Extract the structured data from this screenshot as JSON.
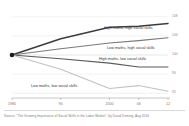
{
  "figure": {
    "background": "#ffffff",
    "source_note": "Source: \"The Growing Importance of Social Skills in the Labor Market\", by David Deming, Aug 2016"
  },
  "chart_data": {
    "type": "line",
    "title": "",
    "subtitle": "",
    "xlabel": "",
    "ylabel": "",
    "x": [
      1980,
      1990,
      2000,
      2006,
      2012
    ],
    "xtick_labels": [
      "1980",
      "90",
      "2000",
      "06",
      "12"
    ],
    "ytick_labels": [
      "108",
      "104",
      "100",
      "96",
      "92"
    ],
    "ytick_values": [
      108,
      104,
      100,
      96,
      92
    ],
    "ylim": [
      91,
      109
    ],
    "xlim": [
      1980,
      2012
    ],
    "grid": true,
    "grid_axis": "y",
    "legend": "inline-labels",
    "origin_marker": {
      "x": 1980,
      "y": 100,
      "color": "#1a1a1a"
    },
    "series": [
      {
        "name": "High maths, high social skills",
        "label": "High maths, high social skills",
        "color": "#3c3c3c",
        "width": 1.5,
        "x": [
          1980,
          1990,
          2000,
          2006,
          2012
        ],
        "values": [
          100,
          103.4,
          105.8,
          106.0,
          106.6
        ]
      },
      {
        "name": "Low maths, high social skills",
        "label": "Low maths, high social skills",
        "color": "#7a7a7a",
        "width": 1.1,
        "x": [
          1980,
          1990,
          2000,
          2006,
          2012
        ],
        "values": [
          100,
          101.3,
          102.5,
          103.0,
          103.6
        ]
      },
      {
        "name": "High maths, low social skills",
        "label": "High maths, low social skills",
        "color": "#5a5a5a",
        "width": 1.1,
        "x": [
          1980,
          1990,
          2000,
          2006,
          2012
        ],
        "values": [
          100,
          99.2,
          98.3,
          97.5,
          97.5
        ]
      },
      {
        "name": "Low maths, low social skills",
        "label": "Low maths, low social skills",
        "color": "#c2c2c2",
        "width": 1.1,
        "x": [
          1980,
          1990,
          2000,
          2006,
          2012
        ],
        "values": [
          100,
          97.0,
          93.0,
          93.6,
          92.4
        ]
      }
    ]
  },
  "labels": {
    "series_0": "High maths, high social skills",
    "series_1": "Low maths, high social skills",
    "series_2": "High maths, low social skills",
    "series_3": "Low maths, low social skills"
  }
}
